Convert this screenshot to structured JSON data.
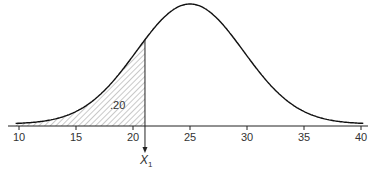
{
  "chart_data": {
    "type": "area",
    "title": "",
    "xlabel": "",
    "ylabel": "",
    "distribution": "normal",
    "mean": 25,
    "std_dev": 4.7,
    "x_ticks": [
      10,
      15,
      20,
      25,
      30,
      35,
      40
    ],
    "xlim": [
      9.5,
      40.5
    ],
    "grid": false,
    "shaded_region": {
      "from": 10,
      "to": 21.05,
      "pattern": "diagonal-hatch",
      "area_label": ".20"
    },
    "marker": {
      "x": 21.05,
      "label": "X",
      "subscript": "1",
      "arrow": "down"
    },
    "colors": {
      "curve": "#111111",
      "axis": "#222222",
      "hatch": "#666666"
    }
  }
}
